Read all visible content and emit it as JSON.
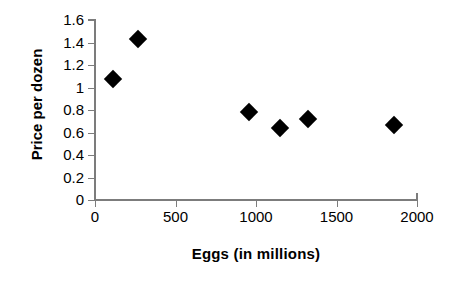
{
  "chart_data": {
    "type": "scatter",
    "title": "",
    "xlabel": "Eggs (in millions)",
    "ylabel": "Price per dozen",
    "xlim": [
      0,
      2000
    ],
    "ylim": [
      0,
      1.6
    ],
    "grid": false,
    "legend": null,
    "xticks": [
      {
        "value": 0,
        "label": "0"
      },
      {
        "value": 500,
        "label": "500"
      },
      {
        "value": 1000,
        "label": "1000"
      },
      {
        "value": 1500,
        "label": "1500"
      },
      {
        "value": 2000,
        "label": "2000"
      }
    ],
    "yticks": [
      {
        "value": 1.6,
        "label": "1.6"
      },
      {
        "value": 1.4,
        "label": "1.4"
      },
      {
        "value": 1.2,
        "label": "1.2"
      },
      {
        "value": 1.0,
        "label": "1"
      },
      {
        "value": 0.8,
        "label": "0.8"
      },
      {
        "value": 0.6,
        "label": "0.6"
      },
      {
        "value": 0.4,
        "label": "0.4"
      },
      {
        "value": 0.2,
        "label": "0.2"
      },
      {
        "value": 0.0,
        "label": "0"
      }
    ],
    "marker": {
      "shape": "diamond",
      "color": "#000000",
      "size": 13
    },
    "points": [
      {
        "x": 110,
        "y": 1.08
      },
      {
        "x": 270,
        "y": 1.43
      },
      {
        "x": 955,
        "y": 0.78
      },
      {
        "x": 1150,
        "y": 0.64
      },
      {
        "x": 1325,
        "y": 0.72
      },
      {
        "x": 1855,
        "y": 0.67
      }
    ],
    "axis_color": "#7c7c7c",
    "background_color": "#ffffff"
  }
}
